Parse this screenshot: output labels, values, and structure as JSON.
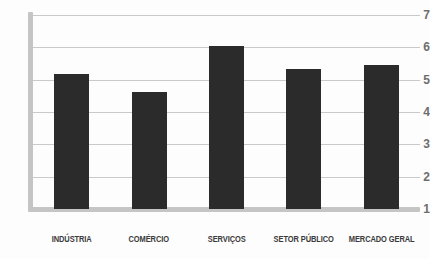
{
  "chart_data": {
    "type": "bar",
    "title": "",
    "subtitle": "",
    "xlabel": "",
    "ylabel": "",
    "categories": [
      "INDÚSTRIA",
      "COMÉRCIO",
      "SERVIÇOS",
      "SETOR PÚBLICO",
      "MERCADO GERAL"
    ],
    "values": [
      5.1,
      4.55,
      5.95,
      5.25,
      5.4
    ],
    "ylim": [
      1,
      7
    ],
    "yticks": [
      1,
      2,
      3,
      4,
      5,
      6,
      7
    ],
    "ytick_labels": [
      "1",
      "2",
      "3",
      "4",
      "5",
      "6",
      "7"
    ],
    "grid": true,
    "legend": null,
    "legend_position": "none",
    "bar_color": "#2b2b2b",
    "gridline_color": "#c9c9c9",
    "axis_color": "#c5c5c5",
    "background_color": "#fdfdfd"
  }
}
